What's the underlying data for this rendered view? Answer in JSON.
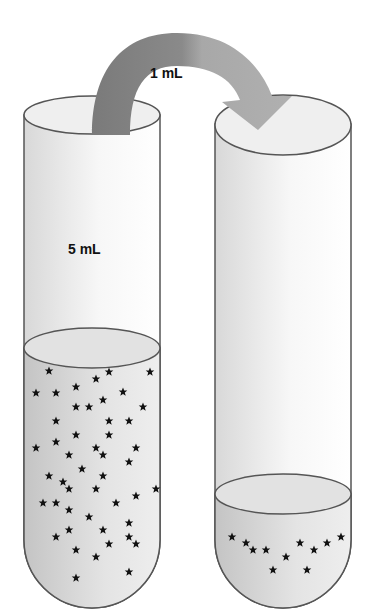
{
  "labels": {
    "transfer_volume": "1 mL",
    "tube1_volume": "5 mL"
  },
  "colors": {
    "arrow_left": "#7a7a7a",
    "arrow_right": "#a6a6a6",
    "outline": "#555555",
    "liquid": "#d0d0d0"
  },
  "tubes": [
    {
      "name": "source-tube",
      "stars": 54
    },
    {
      "name": "receiving-tube",
      "stars": 11
    }
  ]
}
